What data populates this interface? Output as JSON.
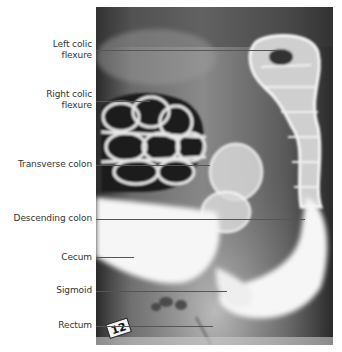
{
  "figure": {
    "marker": "12",
    "colors": {
      "background": "#ffffff",
      "label_text": "#333333",
      "leader_line": "#555555",
      "film_dark": "#2e2e2e",
      "contrast_white": "#f6f6f6"
    }
  },
  "labels": [
    {
      "id": "left-colic-flexure",
      "text_lines": [
        "Left colic",
        "flexure"
      ],
      "line_y": 50,
      "line_x_end": 279
    },
    {
      "id": "right-colic-flexure",
      "text_lines": [
        "Right colic",
        "flexure"
      ],
      "line_y": 101,
      "line_x_end": 150
    },
    {
      "id": "transverse-colon",
      "text_lines": [
        "Transverse colon"
      ],
      "line_y": 165,
      "line_x_end": 210
    },
    {
      "id": "descending-colon",
      "text_lines": [
        "Descending colon"
      ],
      "line_y": 219,
      "line_x_end": 305
    },
    {
      "id": "cecum",
      "text_lines": [
        "Cecum"
      ],
      "line_y": 257,
      "line_x_end": 134
    },
    {
      "id": "sigmoid",
      "text_lines": [
        "Sigmoid"
      ],
      "line_y": 291,
      "line_x_end": 227
    },
    {
      "id": "rectum",
      "text_lines": [
        "Rectum"
      ],
      "line_y": 326,
      "line_x_end": 213
    }
  ],
  "text": {
    "l0a": "Left colic",
    "l0b": "flexure",
    "l1a": "Right colic",
    "l1b": "flexure",
    "l2": "Transverse colon",
    "l3": "Descending colon",
    "l4": "Cecum",
    "l5": "Sigmoid",
    "l6": "Rectum"
  }
}
